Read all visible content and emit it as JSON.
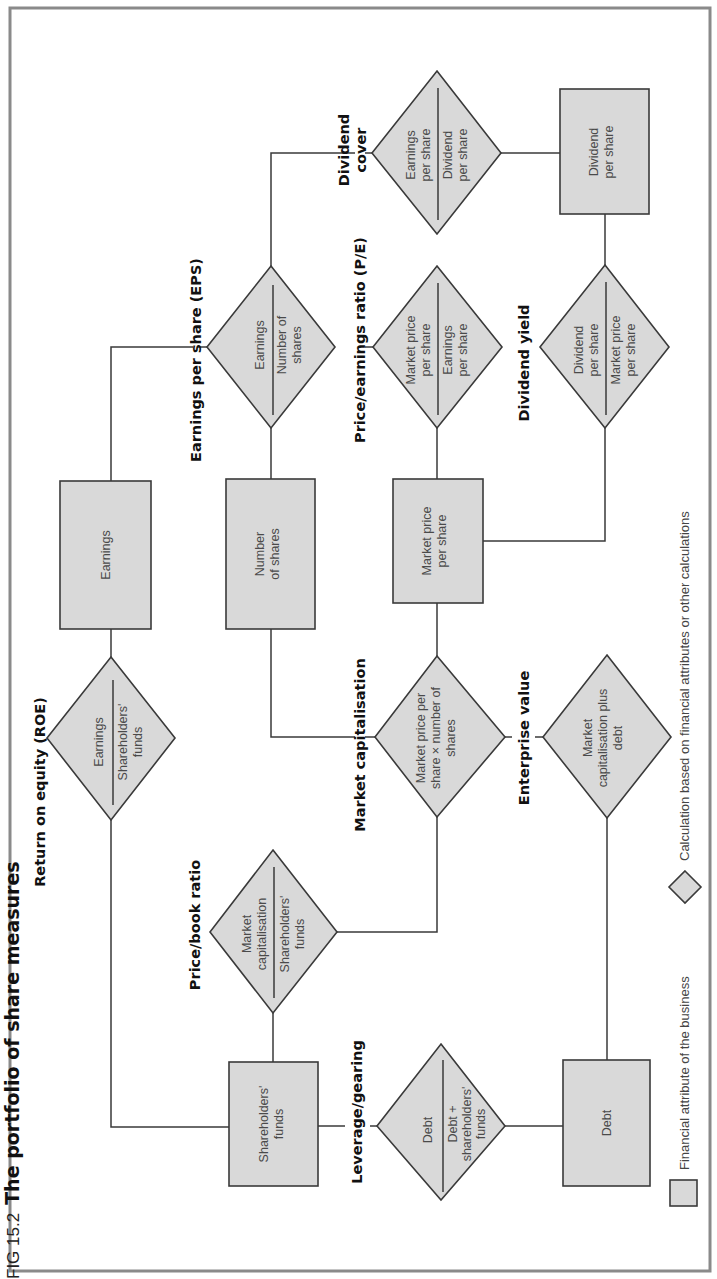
{
  "figure": {
    "number": "FIG 15.2",
    "title": "The portfolio of share measures"
  },
  "colors": {
    "shape_fill": "#d9d9d9",
    "shape_stroke": "#3a3a3a",
    "frame": "#8a8a8a"
  },
  "measures": {
    "roe": {
      "label": "Return on equity (ROE)",
      "numerator": "Earnings",
      "denominator": [
        "Shareholders'",
        "funds"
      ]
    },
    "eps": {
      "label": "Earnings per share (EPS)",
      "numerator": "Earnings",
      "denominator": [
        "Number of",
        "shares"
      ]
    },
    "dividend_cover": {
      "label": [
        "Dividend",
        "cover"
      ],
      "numerator": [
        "Earnings",
        "per share"
      ],
      "denominator": [
        "Dividend",
        "per share"
      ]
    },
    "price_book": {
      "label": "Price/book ratio",
      "numerator": [
        "Market",
        "capitalisation"
      ],
      "denominator": [
        "Shareholders'",
        "funds"
      ]
    },
    "market_cap": {
      "label": "Market capitalisation",
      "formula": [
        "Market price per",
        "share × number of",
        "shares"
      ]
    },
    "pe": {
      "label": "Price/earnings ratio (P/E)",
      "numerator": [
        "Market price",
        "per share"
      ],
      "denominator": [
        "Earnings",
        "per share"
      ]
    },
    "dividend_yield": {
      "label": "Dividend yield",
      "numerator": [
        "Dividend",
        "per share"
      ],
      "denominator": [
        "Market price",
        "per share"
      ]
    },
    "leverage": {
      "label": "Leverage/gearing",
      "numerator": "Debt",
      "denominator": [
        "Debt +",
        "shareholders'",
        "funds"
      ]
    },
    "enterprise_value": {
      "label": "Enterprise value",
      "formula": [
        "Market",
        "capitalisation plus",
        "debt"
      ]
    }
  },
  "attributes": {
    "earnings": [
      "Earnings"
    ],
    "number_of_shares": [
      "Number",
      "of shares"
    ],
    "market_price_per_share": [
      "Market price",
      "per share"
    ],
    "dividend_per_share": [
      "Dividend",
      "per share"
    ],
    "shareholders_funds": [
      "Shareholders'",
      "funds"
    ],
    "debt": [
      "Debt"
    ]
  },
  "legend": {
    "attribute": "Financial attribute of the business",
    "calculation": "Calculation based on financial attributes or other calculations"
  }
}
